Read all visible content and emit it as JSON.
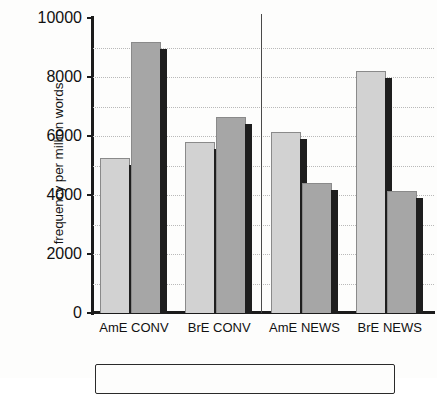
{
  "chart_data": {
    "type": "bar",
    "title": "",
    "subtitle": "",
    "xlabel": "",
    "ylabel": "frequency per million words",
    "categories": [
      "AmE CONV",
      "BrE CONV",
      "AmE NEWS",
      "BrE NEWS"
    ],
    "series": [
      {
        "name": "series-1",
        "color": "#d2d2d2",
        "values": [
          5250,
          5800,
          6150,
          8200
        ]
      },
      {
        "name": "series-2",
        "color": "#a6a6a6",
        "values": [
          9200,
          6650,
          4400,
          4150
        ]
      }
    ],
    "ylim": [
      0,
      10000
    ],
    "ytick_labels": [
      "0",
      "2000",
      "4000",
      "6000",
      "8000",
      "10000"
    ],
    "ytick_values": [
      0,
      2000,
      4000,
      6000,
      8000,
      10000
    ],
    "grid": true,
    "grid_interval": 1000,
    "legend": "none",
    "annotations": {
      "group_divider_after_category": "BrE CONV"
    }
  },
  "figure": {
    "legend_box_label": ""
  }
}
